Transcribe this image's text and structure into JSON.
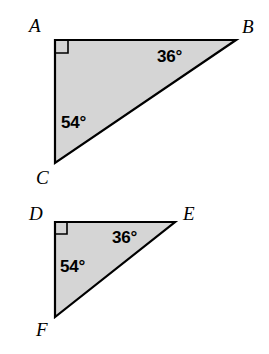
{
  "figure": {
    "width": 269,
    "height": 354,
    "background_color": "#ffffff",
    "fill_color": "#d5d5d5",
    "stroke_color": "#000000"
  },
  "triangles": [
    {
      "id": "triangle-abc",
      "vertices": [
        {
          "label": "A",
          "x": 55,
          "y": 40,
          "label_x": 29,
          "label_y": 16
        },
        {
          "label": "B",
          "x": 236,
          "y": 40,
          "label_x": 242,
          "label_y": 17
        },
        {
          "label": "C",
          "x": 55,
          "y": 163,
          "label_x": 36,
          "label_y": 168
        }
      ],
      "right_angle_at": "A",
      "right_angle_size": 13,
      "angles": [
        {
          "value": "36°",
          "at_vertex": "B",
          "x": 157,
          "y": 48
        },
        {
          "value": "54°",
          "at_vertex": "C",
          "x": 61,
          "y": 114
        }
      ]
    },
    {
      "id": "triangle-def",
      "vertices": [
        {
          "label": "D",
          "x": 55,
          "y": 222,
          "label_x": 29,
          "label_y": 204
        },
        {
          "label": "E",
          "x": 175,
          "y": 222,
          "label_x": 183,
          "label_y": 204
        },
        {
          "label": "F",
          "x": 55,
          "y": 317,
          "label_x": 36,
          "label_y": 320
        }
      ],
      "right_angle_at": "D",
      "right_angle_size": 12,
      "angles": [
        {
          "value": "36°",
          "at_vertex": "E",
          "x": 112,
          "y": 229
        },
        {
          "value": "54°",
          "at_vertex": "F",
          "x": 60,
          "y": 258
        }
      ]
    }
  ]
}
